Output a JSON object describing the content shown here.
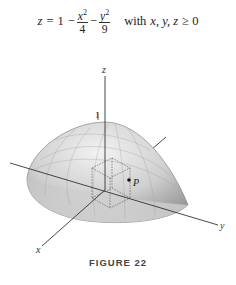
{
  "equation": {
    "lhs": "z",
    "eq": "=",
    "one": "1",
    "minus1": "−",
    "frac1_num_var": "x",
    "frac1_num_exp": "2",
    "frac1_den": "4",
    "minus2": "−",
    "frac2_num_var": "y",
    "frac2_num_exp": "2",
    "frac2_den": "9",
    "condition_prefix": "with",
    "condition_vars": "x, y, z",
    "condition_rel": "≥ 0"
  },
  "figure": {
    "axis_labels": {
      "x": "x",
      "y": "y",
      "z": "z"
    },
    "tick_label_z": "1",
    "point_label": "P",
    "surface_color": "#c8c8c8",
    "axis_color": "#333333"
  },
  "caption": "FIGURE 22"
}
